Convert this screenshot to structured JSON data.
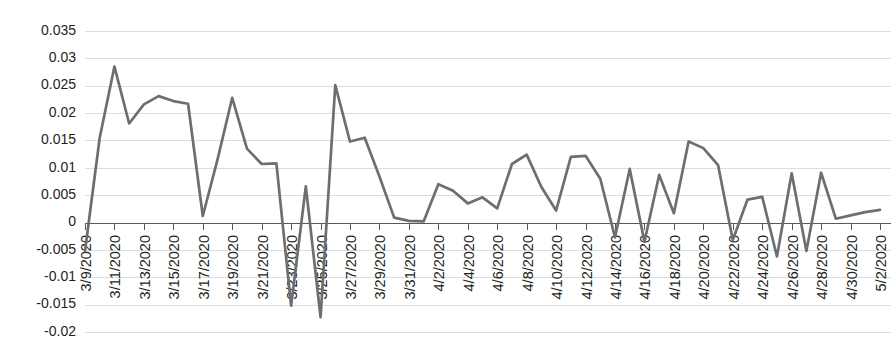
{
  "chart_data": {
    "type": "line",
    "title": "",
    "subtitle": "",
    "xlabel": "",
    "ylabel": "",
    "grid": true,
    "legend": false,
    "legend_position": "none",
    "line_color": "#6d6e71",
    "gridline_color": "#d9dde6",
    "axis_color": "#58595b",
    "ylim": [
      -0.02,
      0.035
    ],
    "ytick_values": [
      0.035,
      0.03,
      0.025,
      0.02,
      0.015,
      0.01,
      0.005,
      0,
      -0.005,
      -0.01,
      -0.015,
      -0.02
    ],
    "ytick_labels": [
      "0.035",
      "0.03",
      "0.025",
      "0.02",
      "0.015",
      "0.01",
      "0.005",
      "0",
      "-0.005",
      "-0.01",
      "-0.015",
      "-0.02"
    ],
    "xtick_labels": [
      "3/9/2020",
      "3/11/2020",
      "3/13/2020",
      "3/15/2020",
      "3/17/2020",
      "3/19/2020",
      "3/21/2020",
      "3/23/2020",
      "3/25/2020",
      "3/27/2020",
      "3/29/2020",
      "3/31/2020",
      "4/2/2020",
      "4/4/2020",
      "4/6/2020",
      "4/8/2020",
      "4/10/2020",
      "4/12/2020",
      "4/14/2020",
      "4/16/2020",
      "4/18/2020",
      "4/20/2020",
      "4/22/2020",
      "4/24/2020",
      "4/26/2020",
      "4/28/2020",
      "4/30/2020",
      "5/2/2020"
    ],
    "xtick_interval_days": 2,
    "categories": [
      "3/9/2020",
      "3/10/2020",
      "3/11/2020",
      "3/12/2020",
      "3/13/2020",
      "3/14/2020",
      "3/15/2020",
      "3/16/2020",
      "3/17/2020",
      "3/18/2020",
      "3/19/2020",
      "3/20/2020",
      "3/21/2020",
      "3/22/2020",
      "3/23/2020",
      "3/24/2020",
      "3/25/2020",
      "3/26/2020",
      "3/27/2020",
      "3/28/2020",
      "3/29/2020",
      "3/30/2020",
      "3/31/2020",
      "4/1/2020",
      "4/2/2020",
      "4/3/2020",
      "4/4/2020",
      "4/5/2020",
      "4/6/2020",
      "4/7/2020",
      "4/8/2020",
      "4/9/2020",
      "4/10/2020",
      "4/11/2020",
      "4/12/2020",
      "4/13/2020",
      "4/14/2020",
      "4/15/2020",
      "4/16/2020",
      "4/17/2020",
      "4/18/2020",
      "4/19/2020",
      "4/20/2020",
      "4/21/2020",
      "4/22/2020",
      "4/23/2020",
      "4/24/2020",
      "4/25/2020",
      "4/26/2020",
      "4/27/2020",
      "4/28/2020",
      "4/29/2020",
      "4/30/2020",
      "5/1/2020",
      "5/2/2020"
    ],
    "values": [
      -0.0052,
      0.0155,
      0.0285,
      0.0181,
      0.0216,
      0.0231,
      0.0222,
      0.0217,
      0.0012,
      0.0115,
      0.0228,
      0.0135,
      0.0107,
      0.0108,
      -0.0152,
      0.0066,
      -0.0173,
      0.0251,
      0.0148,
      0.0155,
      0.0084,
      0.0009,
      0.0003,
      0.0002,
      0.007,
      0.0058,
      0.0035,
      0.0046,
      0.0026,
      0.0107,
      0.0124,
      0.0065,
      0.0022,
      0.012,
      0.0122,
      0.008,
      -0.0027,
      0.0098,
      -0.0035,
      0.0087,
      0.0017,
      0.0148,
      0.0136,
      0.0105,
      -0.0032,
      0.0042,
      0.0047,
      -0.0062,
      0.009,
      -0.0052,
      0.0091,
      0.0007,
      0.0013,
      0.0019,
      0.0023
    ],
    "series_name": "daily value"
  }
}
